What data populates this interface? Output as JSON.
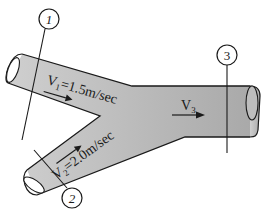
{
  "diagram": {
    "type": "pipe-junction",
    "colors": {
      "pipe_fill": "#b9b9b9",
      "pipe_fill_light": "#c9c9c9",
      "stroke": "#1a1a1a",
      "background": "#ffffff"
    },
    "sections": [
      {
        "id": "1",
        "label": "1"
      },
      {
        "id": "2",
        "label": "2"
      },
      {
        "id": "3",
        "label": "3"
      }
    ],
    "velocities": {
      "v1": {
        "label": "V",
        "subscript": "1",
        "value": "=1.5m/sec"
      },
      "v2": {
        "label": "V",
        "subscript": "2",
        "value": "=2.0m/sec"
      },
      "v3": {
        "label": "V",
        "subscript": "3",
        "value": ""
      }
    }
  }
}
